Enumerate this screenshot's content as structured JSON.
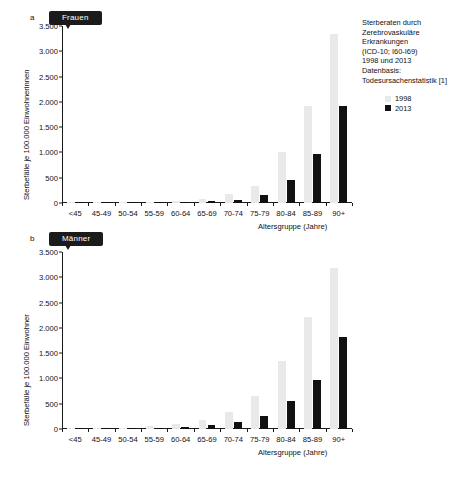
{
  "figure": {
    "panels": [
      {
        "letter": "a",
        "tag": "Frauen",
        "ylabel": "Sterbefälle je 100.000 Einwohnerinnen",
        "xlabel": "Altersgruppe (Jahre)"
      },
      {
        "letter": "b",
        "tag": "Männer",
        "ylabel": "Sterbefälle je 100.000 Einwohner",
        "xlabel": "Altersgruppe (Jahre)"
      }
    ]
  },
  "note": {
    "lines": [
      "Sterberaten durch",
      "Zerebrovaskuläre",
      "Erkrankungen",
      "(ICD-10; I60-I69)",
      "1998 und 2013",
      "Datenbasis:",
      "Todesursachenstatistik [1]"
    ]
  },
  "legend": {
    "entries": [
      {
        "label": "1998",
        "color": "#e9e9e9"
      },
      {
        "label": "2013",
        "color": "#111111"
      }
    ]
  },
  "colors": {
    "series_1998": "#e9e9e9",
    "series_2013": "#111111",
    "axis": "#1a1a1a",
    "text": "#111111",
    "tag_background": "#1b1b1b"
  },
  "chart_data": [
    {
      "type": "bar",
      "id": "panel-a-frauen",
      "title": "Frauen",
      "subtitle": "Sterberaten durch Zerebrovaskuläre Erkrankungen (ICD-10; I60-I69), 1998 und 2013",
      "xlabel": "Altersgruppe (Jahre)",
      "ylabel": "Sterbefälle je 100.000 Einwohnerinnen",
      "ylim": [
        0,
        3500
      ],
      "yticks": [
        0,
        500,
        1000,
        1500,
        2000,
        2500,
        3000,
        3500
      ],
      "ytick_labels": [
        "0",
        "500",
        "1.000",
        "1.500",
        "2.000",
        "2.500",
        "3.000",
        "3.500"
      ],
      "grid": false,
      "legend_position": "upper-right",
      "categories": [
        "<45",
        "45-49",
        "50-54",
        "55-59",
        "60-64",
        "65-69",
        "70-74",
        "75-79",
        "80-84",
        "85-89",
        "90+"
      ],
      "series": [
        {
          "name": "1998",
          "color": "#e9e9e9",
          "values": [
            3,
            8,
            14,
            26,
            48,
            88,
            170,
            335,
            1010,
            1910,
            3350
          ]
        },
        {
          "name": "2013",
          "color": "#111111",
          "values": [
            2,
            4,
            7,
            12,
            21,
            36,
            68,
            160,
            450,
            975,
            1920
          ]
        }
      ]
    },
    {
      "type": "bar",
      "id": "panel-b-maenner",
      "title": "Männer",
      "subtitle": "Sterberaten durch Zerebrovaskuläre Erkrankungen (ICD-10; I60-I69), 1998 und 2013",
      "xlabel": "Altersgruppe (Jahre)",
      "ylabel": "Sterbefälle je 100.000 Einwohner",
      "ylim": [
        0,
        3500
      ],
      "yticks": [
        0,
        500,
        1000,
        1500,
        2000,
        2500,
        3000,
        3500
      ],
      "ytick_labels": [
        "0",
        "500",
        "1.000",
        "1.500",
        "2.000",
        "2.500",
        "3.000",
        "3.500"
      ],
      "grid": false,
      "legend_position": "none",
      "categories": [
        "<45",
        "45-49",
        "50-54",
        "55-59",
        "60-64",
        "65-69",
        "70-74",
        "75-79",
        "80-84",
        "85-89",
        "90+"
      ],
      "series": [
        {
          "name": "1998",
          "color": "#e9e9e9",
          "values": [
            6,
            14,
            26,
            50,
            95,
            180,
            330,
            650,
            1340,
            2210,
            3180
          ]
        },
        {
          "name": "2013",
          "color": "#111111",
          "values": [
            4,
            8,
            15,
            28,
            46,
            82,
            140,
            250,
            560,
            960,
            1820
          ]
        }
      ]
    }
  ]
}
